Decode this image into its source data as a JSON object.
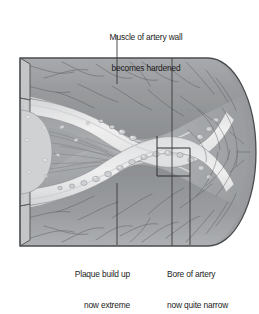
{
  "figure": {
    "type": "medical-illustration-cutaway",
    "background_color": "#ffffff"
  },
  "annotations": {
    "muscle": {
      "name": "muscle-of-artery-wall",
      "line1": "Muscle of artery wall",
      "line2": "becomes hardened",
      "leader": {
        "x": 117,
        "y_top": 35,
        "y_bottom": 84
      }
    },
    "plaque": {
      "name": "plaque-build-up",
      "line1": "Plaque build up",
      "line2": "now extreme",
      "leader": {
        "x": 117,
        "y_top": 183,
        "y_bottom": 245
      }
    },
    "bore": {
      "name": "bore-of-artery",
      "line1": "Bore of artery",
      "line2": "now quite narrow",
      "leader": {
        "x": 190,
        "y_top": 160,
        "y_bottom": 245
      }
    }
  },
  "palette": {
    "outline": "#4a4a4a",
    "wall_muscle_dark": "#8f9194",
    "wall_muscle_mid": "#9ea0a3",
    "wall_muscle_light": "#b4b6b9",
    "cut_face": "#c6c8ca",
    "cut_face_ellipse": "#cfd1d3",
    "lumen": "#a8aaad",
    "lumen_deep": "#9b9da0",
    "plaque_light": "#e4e5e6",
    "plaque_cream": "#eceded",
    "plaque_cell": "#d2d4d6",
    "intima_band": "#dcdddf",
    "fiber_stroke": "#5d5f62",
    "annotation_text": "#1c1c1c",
    "leader_line": "#3a3a3a"
  },
  "structures": [
    {
      "name": "outer-artery-wall",
      "label": "Tunica media / muscular wall"
    },
    {
      "name": "cut-face-left",
      "label": "Longitudinal cut face"
    },
    {
      "name": "plaque-upper",
      "label": "Upper atheromatous plaque"
    },
    {
      "name": "plaque-lower",
      "label": "Lower atheromatous plaque"
    },
    {
      "name": "lumen",
      "label": "Narrowed arterial lumen"
    },
    {
      "name": "bore-marker-bracket",
      "label": "Bracket marking narrow bore"
    }
  ]
}
